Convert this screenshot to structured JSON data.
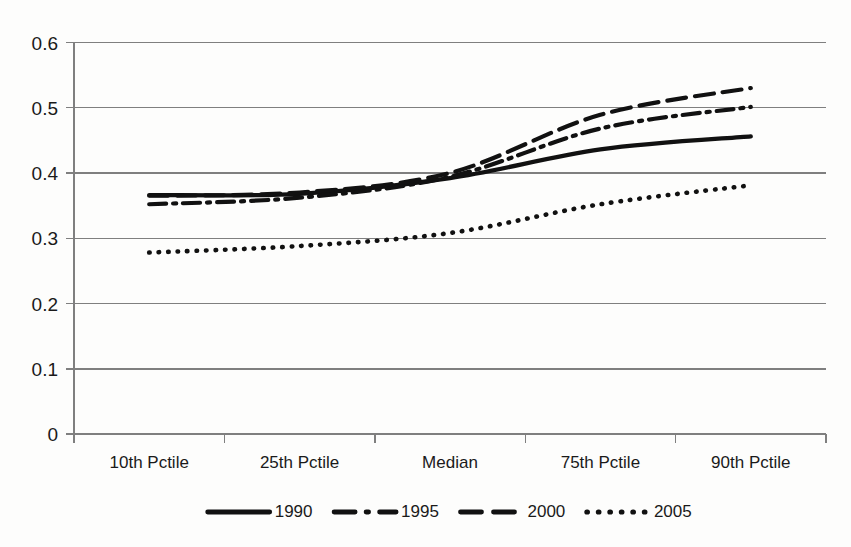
{
  "chart_data": {
    "type": "line",
    "title": "",
    "subtitle": "",
    "xlabel": "",
    "ylabel": "",
    "categories": [
      "10th Pctile",
      "25th Pctile",
      "Median",
      "75th Pctile",
      "90th Pctile"
    ],
    "x": [
      0,
      1,
      2,
      3,
      4
    ],
    "ylim": [
      0,
      0.6
    ],
    "yticks": [
      0,
      0.1,
      0.2,
      0.3,
      0.4,
      0.5,
      0.6
    ],
    "ytick_labels": [
      "0",
      "0.1",
      "0.2",
      "0.3",
      "0.4",
      "0.5",
      "0.6"
    ],
    "grid": "horizontal",
    "legend_position": "bottom",
    "series": [
      {
        "name": "1990",
        "style": "solid",
        "color": "#111111",
        "values": [
          0.366,
          0.368,
          0.392,
          0.436,
          0.456
        ]
      },
      {
        "name": "1995",
        "style": "dash-dot",
        "color": "#111111",
        "values": [
          0.352,
          0.362,
          0.394,
          0.468,
          0.501
        ]
      },
      {
        "name": "2000",
        "style": "dashed",
        "color": "#111111",
        "values": [
          0.365,
          0.37,
          0.4,
          0.489,
          0.53
        ]
      },
      {
        "name": "2005",
        "style": "dotted",
        "color": "#111111",
        "values": [
          0.278,
          0.288,
          0.308,
          0.352,
          0.381
        ]
      }
    ]
  },
  "axes": {
    "y_tick_0": "0",
    "y_tick_1": "0.1",
    "y_tick_2": "0.2",
    "y_tick_3": "0.3",
    "y_tick_4": "0.4",
    "y_tick_5": "0.5",
    "y_tick_6": "0.6",
    "x_tick_0": "10th Pctile",
    "x_tick_1": "25th Pctile",
    "x_tick_2": "Median",
    "x_tick_3": "75th Pctile",
    "x_tick_4": "90th Pctile"
  },
  "legend": {
    "entry_0": "1990",
    "entry_1": "1995",
    "entry_2": "2000",
    "entry_3": "2005"
  },
  "colors": {
    "grid": "#7f7f7f",
    "axis": "#7f7f7f",
    "series": "#111111",
    "background": "#fdfdfc",
    "text": "#1a1a1a"
  }
}
